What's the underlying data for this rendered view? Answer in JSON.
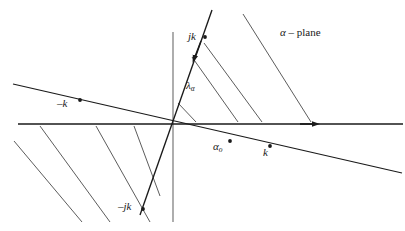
{
  "figure": {
    "background_color": "#ffffff",
    "line_color": "#1a1a1a",
    "hatch_color": "#4a4a4a",
    "width": 405,
    "height": 231,
    "labels": {
      "plane_alpha": "α",
      "plane_dash": " – ",
      "plane_word": "plane",
      "jk": "jk",
      "neg_jk": "–jk",
      "neg_k": "–k",
      "k": "k",
      "lambda_alpha_base": "λ",
      "lambda_alpha_sub": "α",
      "alpha_zero_base": "α",
      "alpha_zero_sub": "o"
    },
    "geometry": {
      "origin": [
        172,
        124
      ],
      "real_axis": {
        "x1": 18,
        "y1": 124,
        "x2": 403,
        "y2": 124,
        "arrow_at": [
          318,
          124
        ]
      },
      "imaginary_axis": {
        "x1": 173,
        "y1": 32,
        "x2": 173,
        "y2": 222
      },
      "steep_contour": {
        "x1": 212,
        "y1": 10,
        "x2": 140,
        "y2": 215,
        "arrow_at": [
          190,
          62
        ]
      },
      "tilted_contour": {
        "x1": 13,
        "y1": 84,
        "x2": 402,
        "y2": 173
      },
      "marker_points": {
        "jk": [
          205,
          37
        ],
        "neg_jk": [
          143,
          209
        ],
        "neg_k": [
          80,
          100
        ],
        "k": [
          270,
          146
        ],
        "alpha_zero": [
          230,
          141
        ]
      },
      "hatch_upper_right": [
        {
          "x1": 243,
          "y1": 14,
          "x2": 311,
          "y2": 122
        },
        {
          "x1": 204,
          "y1": 43,
          "x2": 262,
          "y2": 122
        },
        {
          "x1": 192,
          "y1": 57,
          "x2": 238,
          "y2": 122
        },
        {
          "x1": 178,
          "y1": 103,
          "x2": 196,
          "y2": 122
        }
      ],
      "hatch_lower_left": [
        {
          "x1": 14,
          "y1": 141,
          "x2": 82,
          "y2": 222
        },
        {
          "x1": 40,
          "y1": 126,
          "x2": 110,
          "y2": 222
        },
        {
          "x1": 96,
          "y1": 126,
          "x2": 150,
          "y2": 222
        },
        {
          "x1": 134,
          "y1": 126,
          "x2": 160,
          "y2": 196
        }
      ]
    }
  }
}
